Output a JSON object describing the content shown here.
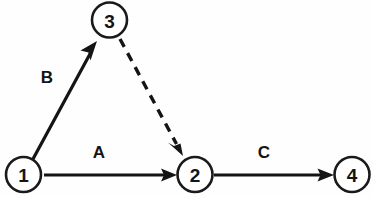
{
  "diagram": {
    "type": "activity-network-diagram",
    "width": 373,
    "height": 197,
    "background_color": "#fefefe",
    "stroke_color": "#141414",
    "node_fill_color": "#ffffff",
    "nodes": [
      {
        "id": "node-1",
        "label": "1",
        "cx": 23.5,
        "cy": 174.5,
        "r": 17.5
      },
      {
        "id": "node-3",
        "label": "3",
        "cx": 109.5,
        "cy": 20.0,
        "r": 17.5
      },
      {
        "id": "node-2",
        "label": "2",
        "cx": 195.0,
        "cy": 174.5,
        "r": 17.5
      },
      {
        "id": "node-4",
        "label": "4",
        "cx": 352.0,
        "cy": 174.5,
        "r": 17.5
      }
    ],
    "edges": [
      {
        "id": "edge-a",
        "label": "A",
        "from": "node-1",
        "to": "node-2",
        "style": "solid",
        "arrow": true,
        "x1": 44,
        "y1": 175,
        "x2": 177,
        "y2": 175,
        "label_x": 99,
        "label_y": 152
      },
      {
        "id": "edge-b",
        "label": "B",
        "from": "node-1",
        "to": "node-3",
        "style": "solid",
        "arrow": true,
        "x1": 33,
        "y1": 159,
        "x2": 97,
        "y2": 41,
        "label_x": 47,
        "label_y": 77
      },
      {
        "id": "edge-dashed",
        "label": "",
        "from": "node-3",
        "to": "node-2",
        "style": "dashed",
        "arrow": true,
        "x1": 120,
        "y1": 39,
        "x2": 183,
        "y2": 156,
        "label_x": 0,
        "label_y": 0
      },
      {
        "id": "edge-c",
        "label": "C",
        "from": "node-2",
        "to": "node-4",
        "style": "solid",
        "arrow": true,
        "x1": 214,
        "y1": 175,
        "x2": 334,
        "y2": 175,
        "label_x": 264,
        "label_y": 152
      }
    ]
  }
}
